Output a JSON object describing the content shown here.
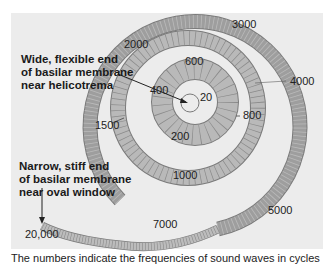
{
  "figure": {
    "background_color": "#ececec",
    "membrane_fill": "#b9b9b9",
    "membrane_stroke": "#7a7a7a",
    "annotations": {
      "apex": [
        "Wide, flexible end",
        "of basilar membrane",
        "near helicotrema"
      ],
      "base": [
        "Narrow, stiff end",
        "of basilar membrane",
        "near oval window"
      ]
    },
    "frequency_labels": [
      {
        "value": "20",
        "x": 200,
        "y": 98
      },
      {
        "value": "200",
        "x": 169,
        "y": 138
      },
      {
        "value": "400",
        "x": 150,
        "y": 90
      },
      {
        "value": "600",
        "x": 185,
        "y": 55
      },
      {
        "value": "800",
        "x": 242,
        "y": 111
      },
      {
        "value": "1000",
        "x": 173,
        "y": 168
      },
      {
        "value": "1500",
        "x": 95,
        "y": 120
      },
      {
        "value": "2000",
        "x": 124,
        "y": 38
      },
      {
        "value": "3000",
        "x": 232,
        "y": 18
      },
      {
        "value": "4000",
        "x": 289,
        "y": 76
      },
      {
        "value": "5000",
        "x": 268,
        "y": 206
      },
      {
        "value": "7000",
        "x": 153,
        "y": 222
      },
      {
        "value": "20,000",
        "x": 24,
        "y": 229
      }
    ],
    "caption": "The numbers indicate the frequencies of sound waves in cycles"
  }
}
